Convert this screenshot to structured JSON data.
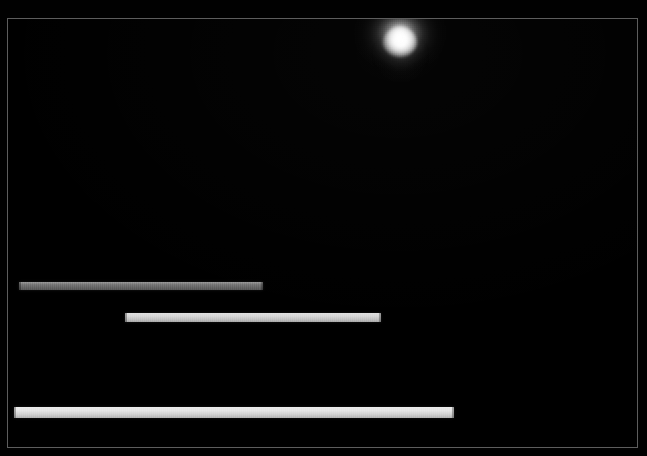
{
  "scene": {
    "title": "Dark Scene Render",
    "background_color": "#000000",
    "frame": {
      "name": "viewport-border",
      "color": "#5d5d5d",
      "x": 7,
      "y": 18,
      "width": 631,
      "height": 430
    }
  },
  "light_source": {
    "name": "point-light-glow",
    "label": "Light source",
    "center_x": 399,
    "center_y": 41,
    "core_color": "#ffffff",
    "halo_color": "#8c8c8c",
    "radius": 54
  },
  "bars": [
    {
      "name": "light-bar-1",
      "label": "Bar 1",
      "x": 18,
      "y": 281,
      "width": 244,
      "height": 8,
      "color": "#6e6e6e",
      "brightness": "dim"
    },
    {
      "name": "light-bar-2",
      "label": "Bar 2",
      "x": 124,
      "y": 312,
      "width": 256,
      "height": 9,
      "color": "#d6d6d6",
      "brightness": "bright"
    },
    {
      "name": "light-bar-3",
      "label": "Bar 3",
      "x": 13,
      "y": 406,
      "width": 440,
      "height": 11,
      "color": "#e4e4e4",
      "brightness": "brightest"
    }
  ]
}
